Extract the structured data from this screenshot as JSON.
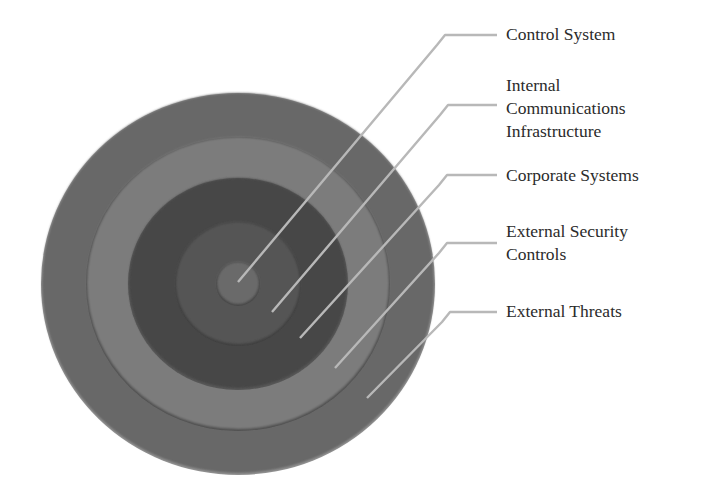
{
  "diagram": {
    "type": "concentric-layers",
    "center": {
      "cx": 238,
      "cy": 283
    },
    "layers": [
      {
        "id": "external-threats",
        "label": "External Threats",
        "rx": 196,
        "ry": 190,
        "color": "#676767"
      },
      {
        "id": "external-security-controls",
        "label": "External Security Controls",
        "rx": 151,
        "ry": 146,
        "color": "#7b7b7b"
      },
      {
        "id": "corporate-systems",
        "label": "Corporate Systems",
        "rx": 109,
        "ry": 105,
        "color": "#464646"
      },
      {
        "id": "internal-communications-infrastructure",
        "label": "Internal Communications Infrastructure",
        "rx": 62,
        "ry": 61,
        "color": "#555555"
      },
      {
        "id": "control-system",
        "label": "Control System",
        "rx": 21,
        "ry": 21,
        "color": "#6a6a6a"
      }
    ],
    "callouts": [
      {
        "id": "control-system",
        "lines": [
          "Control System"
        ],
        "label_top": 23,
        "elbow": {
          "x1": 445,
          "y": 35,
          "x2": 497
        },
        "end": {
          "x": 238,
          "y": 282
        }
      },
      {
        "id": "internal-communications-infrastructure",
        "lines": [
          "Internal",
          "Communications",
          "Infrastructure"
        ],
        "label_top": 74,
        "elbow": {
          "x1": 448,
          "y": 105,
          "x2": 497
        },
        "end": {
          "x": 272,
          "y": 312
        }
      },
      {
        "id": "corporate-systems",
        "lines": [
          "Corporate Systems"
        ],
        "label_top": 164,
        "elbow": {
          "x1": 447,
          "y": 175,
          "x2": 497
        },
        "end": {
          "x": 300,
          "y": 338
        }
      },
      {
        "id": "external-security-controls",
        "lines": [
          "External Security",
          "Controls"
        ],
        "label_top": 220,
        "elbow": {
          "x1": 447,
          "y": 243,
          "x2": 497
        },
        "end": {
          "x": 335,
          "y": 368
        }
      },
      {
        "id": "external-threats",
        "lines": [
          "External Threats"
        ],
        "label_top": 300,
        "elbow": {
          "x1": 450,
          "y": 312,
          "x2": 497
        },
        "end": {
          "x": 367,
          "y": 398
        }
      }
    ],
    "colors": {
      "leader_line": "#b8b8b8",
      "leader_line_inner": "#c9c9c9",
      "text": "#2b2b2b"
    }
  }
}
